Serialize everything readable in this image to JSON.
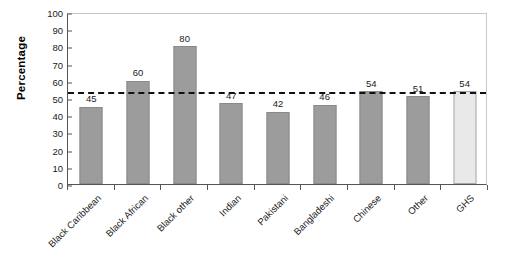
{
  "chart_data": {
    "type": "bar",
    "title": "",
    "xlabel": "",
    "ylabel": "Percentage",
    "ylim": [
      0,
      100
    ],
    "ytick_step": 10,
    "yticks": [
      100,
      90,
      80,
      70,
      60,
      50,
      40,
      30,
      20,
      10,
      0
    ],
    "grid": false,
    "legend": null,
    "categories": [
      "Black Caribbean",
      "Black African",
      "Black other",
      "Indian",
      "Pakistani",
      "Bangladeshi",
      "Chinese",
      "Other",
      "GHS"
    ],
    "values": [
      45,
      60,
      80,
      47,
      42,
      46,
      54,
      51,
      54
    ],
    "value_labels": [
      "45",
      "60",
      "80",
      "47",
      "42",
      "46",
      "54",
      "51",
      "54"
    ],
    "bar_colors": [
      "#9c9c9c",
      "#9c9c9c",
      "#9c9c9c",
      "#9c9c9c",
      "#9c9c9c",
      "#9c9c9c",
      "#9c9c9c",
      "#9c9c9c",
      "#e9e9e9"
    ],
    "reference_line": {
      "value": 54,
      "style": "dashed",
      "color": "#111111"
    },
    "colors": {
      "bar_fill": "#9c9c9c",
      "bar_stroke": "#8a8a8a",
      "reference_bar_fill": "#e9e9e9",
      "reference_bar_stroke": "#a8a8a8",
      "axis": "#555555",
      "frame": "#c8c8c8",
      "text": "#1a1a1a",
      "background": "#ffffff"
    }
  }
}
